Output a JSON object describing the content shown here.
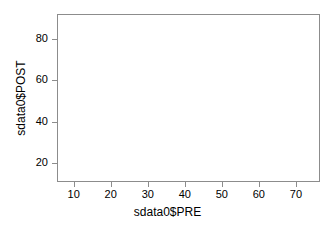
{
  "chart_data": {
    "type": "scatter",
    "title": "",
    "xlabel": "sdata0$PRE",
    "ylabel": "sdata0$POST",
    "xticks": [
      10,
      20,
      30,
      40,
      50,
      60,
      70
    ],
    "yticks": [
      20,
      40,
      60,
      80
    ],
    "xlim": [
      5.5,
      76.5
    ],
    "ylim": [
      11.0,
      92.0
    ],
    "grid": false,
    "legend": null,
    "series": [
      {
        "name": "sdata0",
        "x": [],
        "y": []
      }
    ],
    "note": "empty plot panel - no data points rendered"
  },
  "style": {
    "frame_color": "#8c8c8c",
    "tick_color": "#8c8c8c",
    "text_color": "#000000",
    "background": "#ffffff",
    "point_color": "#000000"
  }
}
